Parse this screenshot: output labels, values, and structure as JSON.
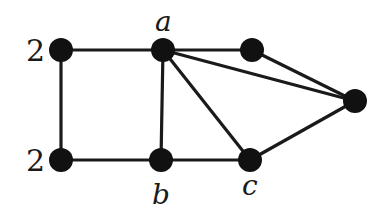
{
  "diagram": {
    "type": "graph",
    "nodes": [
      {
        "id": "tl",
        "x": 61,
        "y": 50,
        "label": "2",
        "label_x": 26,
        "label_y": 61
      },
      {
        "id": "a",
        "x": 163,
        "y": 50,
        "label": "a",
        "label_x": 155,
        "label_y": 31
      },
      {
        "id": "tr",
        "x": 252,
        "y": 50,
        "label": ""
      },
      {
        "id": "fr",
        "x": 355,
        "y": 101,
        "label": ""
      },
      {
        "id": "bl",
        "x": 61,
        "y": 160,
        "label": "2",
        "label_x": 26,
        "label_y": 171
      },
      {
        "id": "b",
        "x": 161,
        "y": 160,
        "label": "b",
        "label_x": 152,
        "label_y": 204
      },
      {
        "id": "c",
        "x": 250,
        "y": 160,
        "label": "c",
        "label_x": 242,
        "label_y": 195
      }
    ],
    "edges": [
      [
        "tl",
        "a"
      ],
      [
        "a",
        "tr"
      ],
      [
        "tr",
        "fr"
      ],
      [
        "a",
        "fr"
      ],
      [
        "a",
        "c"
      ],
      [
        "a",
        "b"
      ],
      [
        "tl",
        "bl"
      ],
      [
        "bl",
        "b"
      ],
      [
        "b",
        "c"
      ],
      [
        "c",
        "fr"
      ]
    ],
    "colors": {
      "node": "#111111",
      "edge": "#1a1a1a",
      "background": "#ffffff"
    }
  }
}
